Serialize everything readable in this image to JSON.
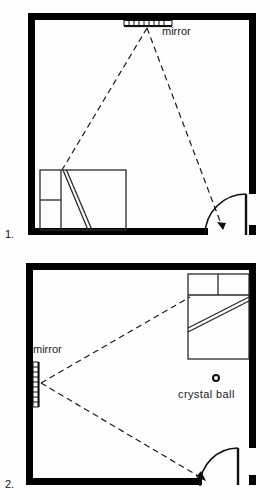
{
  "figure": {
    "background_color": "#fefefe",
    "wall_color": "#000000",
    "line_color": "#1a1a1a",
    "sightline_style": "dashed"
  },
  "panels": [
    {
      "number": "1.",
      "room": {
        "name": "bedroom",
        "wall_thickness_px": 7,
        "shape": "rectangle"
      },
      "mirror": {
        "label": "mirror",
        "position": "top wall, centered",
        "orientation": "horizontal"
      },
      "bed": {
        "position": "bottom left",
        "orientation": "headboard left",
        "pillow_count": 2
      },
      "door": {
        "position": "bottom right",
        "swing": "inward arc",
        "leaf": "vertical on right wall"
      },
      "sightlines": [
        {
          "from": "mirror",
          "to": "bed corner"
        },
        {
          "from": "mirror",
          "to": "doorway",
          "arrowhead": true
        }
      ],
      "crystal_ball": null
    },
    {
      "number": "2.",
      "room": {
        "name": "bedroom",
        "wall_thickness_px": 7,
        "shape": "rectangle"
      },
      "mirror": {
        "label": "mirror",
        "position": "left wall",
        "orientation": "vertical"
      },
      "bed": {
        "position": "top right",
        "orientation": "headboard top",
        "pillow_count": 2
      },
      "door": {
        "position": "bottom right",
        "swing": "inward arc",
        "leaf": "vertical on right wall"
      },
      "sightlines": [
        {
          "from": "mirror",
          "to": "bed corner"
        },
        {
          "from": "mirror",
          "to": "doorway",
          "arrowhead": true
        }
      ],
      "crystal_ball": {
        "label": "crystal ball",
        "position": "center right of room",
        "symbol": "small circle"
      }
    }
  ],
  "labels": {
    "mirror_1": "mirror",
    "mirror_2": "mirror",
    "crystal_ball": "crystal ball",
    "panel_1_number": "1.",
    "panel_2_number": "2."
  }
}
